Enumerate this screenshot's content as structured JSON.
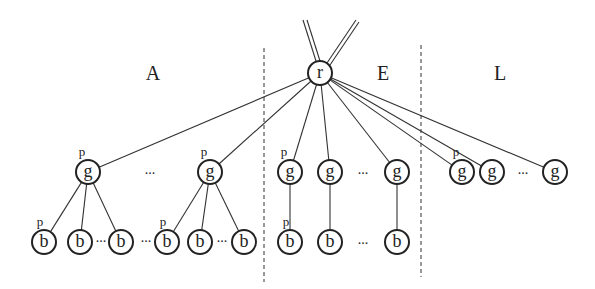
{
  "diagram": {
    "root": {
      "label": "r",
      "x": 320,
      "y": 73
    },
    "regions": [
      {
        "label": "A",
        "x": 153,
        "y": 80
      },
      {
        "label": "E",
        "x": 383,
        "y": 80
      },
      {
        "label": "L",
        "x": 500,
        "y": 80
      }
    ],
    "separators": [
      {
        "x": 264,
        "y1": 48,
        "y2": 282
      },
      {
        "x": 421,
        "y1": 45,
        "y2": 277
      }
    ],
    "g_nodes": [
      {
        "label": "g",
        "x": 88,
        "y": 172,
        "region": "A",
        "p": true
      },
      {
        "label": "g",
        "x": 210,
        "y": 172,
        "region": "A",
        "p": true
      },
      {
        "label": "g",
        "x": 290,
        "y": 172,
        "region": "E",
        "p": true
      },
      {
        "label": "g",
        "x": 330,
        "y": 172,
        "region": "E",
        "p": false
      },
      {
        "label": "g",
        "x": 397,
        "y": 172,
        "region": "E",
        "p": false
      },
      {
        "label": "g",
        "x": 462,
        "y": 172,
        "region": "L",
        "p": true
      },
      {
        "label": "g",
        "x": 492,
        "y": 172,
        "region": "L",
        "p": false
      },
      {
        "label": "g",
        "x": 555,
        "y": 172,
        "region": "L",
        "p": false
      }
    ],
    "b_nodes": [
      {
        "label": "b",
        "x": 44,
        "y": 242,
        "parent": 0,
        "p": true
      },
      {
        "label": "b",
        "x": 80,
        "y": 242,
        "parent": 0,
        "p": false
      },
      {
        "label": "b",
        "x": 121,
        "y": 242,
        "parent": 0,
        "p": false
      },
      {
        "label": "b",
        "x": 167,
        "y": 242,
        "parent": 1,
        "p": true
      },
      {
        "label": "b",
        "x": 200,
        "y": 242,
        "parent": 1,
        "p": false
      },
      {
        "label": "b",
        "x": 244,
        "y": 242,
        "parent": 1,
        "p": false
      },
      {
        "label": "b",
        "x": 290,
        "y": 242,
        "parent": 2,
        "p": true
      },
      {
        "label": "b",
        "x": 330,
        "y": 242,
        "parent": 3,
        "p": false
      },
      {
        "label": "b",
        "x": 397,
        "y": 242,
        "parent": 4,
        "p": false
      }
    ],
    "ellipses": [
      {
        "text": "...",
        "x": 150,
        "y": 174
      },
      {
        "text": "...",
        "x": 363,
        "y": 174
      },
      {
        "text": "...",
        "x": 523,
        "y": 174
      },
      {
        "text": "...",
        "x": 101,
        "y": 242
      },
      {
        "text": "...",
        "x": 146,
        "y": 242
      },
      {
        "text": "...",
        "x": 222,
        "y": 242
      },
      {
        "text": "...",
        "x": 363,
        "y": 244
      }
    ],
    "p_label": "p",
    "node_radius": 12
  }
}
